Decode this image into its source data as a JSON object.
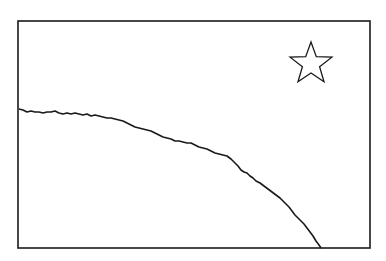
{
  "drawing": {
    "description": "Line drawing: rectangular frame containing a curved horizon arc and an outlined five-pointed star",
    "stroke_color": "#1a1a1a",
    "background_color": "#ffffff",
    "frame": {
      "x": 18,
      "y": 21,
      "width": 352,
      "height": 227
    },
    "star": {
      "cx": 311,
      "cy": 64,
      "outer_radius": 22,
      "inner_radius": 9,
      "points": 5
    },
    "horizon_curve": {
      "start": [
        19,
        109
      ],
      "end": [
        320,
        248
      ]
    }
  }
}
